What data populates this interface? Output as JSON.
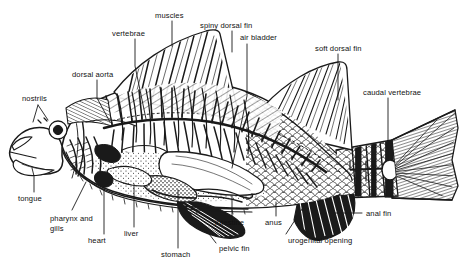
{
  "figure": {
    "kind": "anatomical-diagram",
    "style": "black and white line engraving / hatched woodcut",
    "background_color": "#ffffff",
    "ink_color": "#111111",
    "width": 464,
    "height": 270
  },
  "labels": [
    {
      "id": "muscles",
      "text": "muscles",
      "x": 155,
      "y": 11,
      "align": "left"
    },
    {
      "id": "spiny-dorsal-fin",
      "text": "spiny dorsal fin",
      "x": 200,
      "y": 21,
      "align": "left"
    },
    {
      "id": "vertebrae",
      "text": "vertebrae",
      "x": 112,
      "y": 29,
      "align": "left"
    },
    {
      "id": "air-bladder",
      "text": "air bladder",
      "x": 240,
      "y": 33,
      "align": "left"
    },
    {
      "id": "soft-dorsal-fin",
      "text": "soft dorsal fin",
      "x": 315,
      "y": 44,
      "align": "left"
    },
    {
      "id": "dorsal-aorta",
      "text": "dorsal aorta",
      "x": 72,
      "y": 70,
      "align": "left"
    },
    {
      "id": "caudal-vertebrae",
      "text": "caudal vertebrae",
      "x": 363,
      "y": 88,
      "align": "left"
    },
    {
      "id": "nostrils",
      "text": "nostrils",
      "x": 22,
      "y": 94,
      "align": "left"
    },
    {
      "id": "tongue",
      "text": "tongue",
      "x": 18,
      "y": 194,
      "align": "left"
    },
    {
      "id": "anal-fin",
      "text": "anal fin",
      "x": 366,
      "y": 209,
      "align": "left"
    },
    {
      "id": "intestine",
      "text": "intestine",
      "x": 215,
      "y": 218,
      "align": "left"
    },
    {
      "id": "anus",
      "text": "anus",
      "x": 265,
      "y": 218,
      "align": "left"
    },
    {
      "id": "pharynx-and-gills",
      "text": "pharynx and gills",
      "x": 50,
      "y": 214,
      "align": "left",
      "wrap": true
    },
    {
      "id": "liver",
      "text": "liver",
      "x": 124,
      "y": 229,
      "align": "left"
    },
    {
      "id": "heart",
      "text": "heart",
      "x": 88,
      "y": 236,
      "align": "left"
    },
    {
      "id": "urogenital-opening",
      "text": "urogenital opening",
      "x": 288,
      "y": 236,
      "align": "left"
    },
    {
      "id": "pelvic-fin",
      "text": "pelvic fin",
      "x": 219,
      "y": 244,
      "align": "left"
    },
    {
      "id": "stomach",
      "text": "stomach",
      "x": 161,
      "y": 250,
      "align": "left"
    }
  ]
}
